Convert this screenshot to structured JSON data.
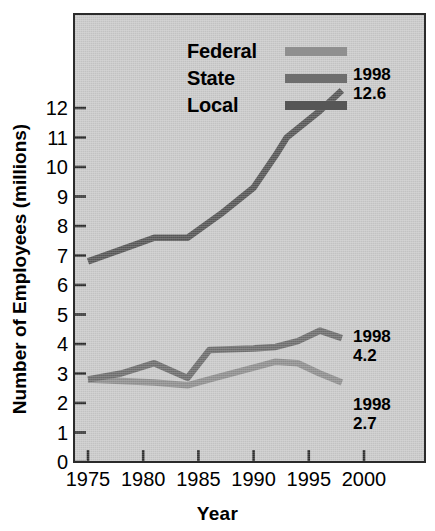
{
  "chart_data": {
    "type": "line",
    "title": "",
    "xlabel": "Year",
    "ylabel": "Number of Employees (millions)",
    "xlim": [
      1973.5,
      2001.5
    ],
    "ylim": [
      0,
      12.8
    ],
    "xticks": [
      1975,
      1980,
      1985,
      1990,
      1995,
      2000
    ],
    "yticks": [
      0,
      1,
      2,
      3,
      4,
      5,
      6,
      7,
      8,
      9,
      10,
      11,
      12
    ],
    "grid": false,
    "legend_position": "top-left-inside",
    "series": [
      {
        "name": "Federal",
        "color": "#8f8f8f",
        "x": [
          1975,
          1978,
          1981,
          1984,
          1987,
          1990,
          1992,
          1994,
          1996,
          1998
        ],
        "values": [
          2.8,
          2.75,
          2.7,
          2.6,
          2.9,
          3.2,
          3.4,
          3.35,
          3.0,
          2.7
        ]
      },
      {
        "name": "State",
        "color": "#6e6e6e",
        "x": [
          1975,
          1978,
          1981,
          1984,
          1986,
          1990,
          1992,
          1994,
          1996,
          1998
        ],
        "values": [
          2.8,
          3.0,
          3.35,
          2.85,
          3.8,
          3.85,
          3.9,
          4.1,
          4.45,
          4.2
        ]
      },
      {
        "name": "Local",
        "color": "#565656",
        "x": [
          1975,
          1978,
          1981,
          1984,
          1987,
          1990,
          1992,
          1993,
          1996,
          1998
        ],
        "values": [
          6.8,
          7.2,
          7.6,
          7.6,
          8.4,
          9.3,
          10.4,
          11.0,
          11.9,
          12.6
        ]
      }
    ],
    "annotations": [
      {
        "series": "Local",
        "year": "1998",
        "value": "12.6"
      },
      {
        "series": "State",
        "year": "1998",
        "value": "4.2"
      },
      {
        "series": "Federal",
        "year": "1998",
        "value": "2.7"
      }
    ]
  },
  "legend": {
    "items": [
      {
        "label": "Federal",
        "color": "#8f8f8f"
      },
      {
        "label": "State",
        "color": "#6e6e6e"
      },
      {
        "label": "Local",
        "color": "#565656"
      }
    ]
  },
  "axes": {
    "y_title": "Number of Employees (millions)",
    "x_title": "Year",
    "y_ticks": [
      "12",
      "11",
      "10",
      "9",
      "8",
      "7",
      "6",
      "5",
      "4",
      "3",
      "2",
      "1",
      "0"
    ],
    "x_ticks": [
      "1975",
      "1980",
      "1985",
      "1990",
      "1995",
      "2000"
    ]
  },
  "colors": {
    "plot_background": "#c9c9c9",
    "page_background": "#ffffff",
    "frame": "#2b2b2b",
    "text": "#000000"
  }
}
